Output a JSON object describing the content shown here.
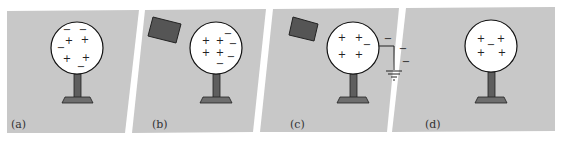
{
  "figure": {
    "panel_fill": "#c8c8c8",
    "sphere_fill": "#ffffff",
    "stand_fill": "#6e6e6e",
    "rod_fill": "#5a5a5a",
    "panels": [
      {
        "label": "(a)",
        "description": "Neutral conductor with mixed charges",
        "charges": [
          {
            "sign": "−",
            "x": 67,
            "y": 32
          },
          {
            "sign": "−",
            "x": 83,
            "y": 32
          },
          {
            "sign": "+",
            "x": 68,
            "y": 42
          },
          {
            "sign": "+",
            "x": 84,
            "y": 41
          },
          {
            "sign": "−",
            "x": 59,
            "y": 49
          },
          {
            "sign": "+",
            "x": 66,
            "y": 60
          },
          {
            "sign": "+",
            "x": 85,
            "y": 59
          },
          {
            "sign": "−",
            "x": 80,
            "y": 67
          }
        ]
      },
      {
        "label": "(b)",
        "description": "Negatively charged rod brought near",
        "charges": [
          {
            "sign": "+",
            "x": 205,
            "y": 42
          },
          {
            "sign": "+",
            "x": 220,
            "y": 42
          },
          {
            "sign": "−",
            "x": 228,
            "y": 35
          },
          {
            "sign": "−",
            "x": 232,
            "y": 45
          },
          {
            "sign": "+",
            "x": 205,
            "y": 54
          },
          {
            "sign": "+",
            "x": 220,
            "y": 54
          },
          {
            "sign": "−",
            "x": 231,
            "y": 58
          },
          {
            "sign": "−",
            "x": 221,
            "y": 65
          }
        ]
      },
      {
        "label": "(c)",
        "description": "Conductor grounded while rod is near",
        "charges": [
          {
            "sign": "+",
            "x": 342,
            "y": 39
          },
          {
            "sign": "+",
            "x": 359,
            "y": 39
          },
          {
            "sign": "−",
            "x": 366,
            "y": 46
          },
          {
            "sign": "+",
            "x": 342,
            "y": 56
          },
          {
            "sign": "+",
            "x": 359,
            "y": 56
          },
          {
            "sign": "−",
            "x": 390,
            "y": 40
          },
          {
            "sign": "−",
            "x": 403,
            "y": 50
          },
          {
            "sign": "−",
            "x": 406,
            "y": 63
          }
        ]
      },
      {
        "label": "(d)",
        "description": "Ground and rod removed; net positive charge",
        "charges": [
          {
            "sign": "+",
            "x": 481,
            "y": 40
          },
          {
            "sign": "+",
            "x": 500,
            "y": 40
          },
          {
            "sign": "−",
            "x": 491,
            "y": 45
          },
          {
            "sign": "+",
            "x": 481,
            "y": 54
          },
          {
            "sign": "+",
            "x": 502,
            "y": 54
          }
        ]
      }
    ]
  }
}
